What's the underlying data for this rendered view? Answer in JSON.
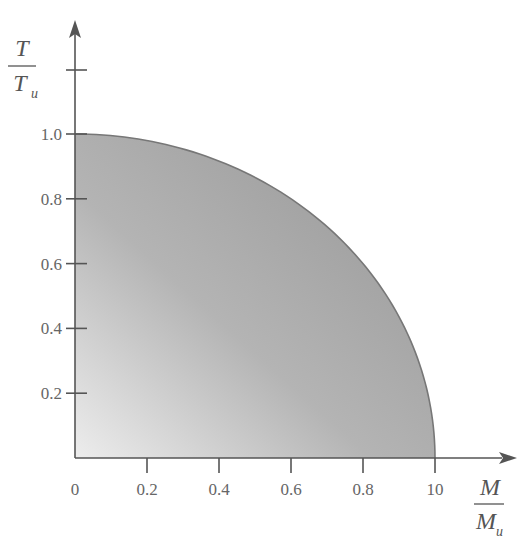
{
  "chart_data": {
    "type": "area",
    "title": "",
    "xlabel": "M / M_u",
    "ylabel": "T / T_u",
    "xlabel_parts": {
      "numerator": "M",
      "denominator": "M",
      "subscript": "u"
    },
    "ylabel_parts": {
      "numerator": "T",
      "denominator": "T",
      "subscript": "u"
    },
    "x_ticks": [
      "0",
      "0.2",
      "0.4",
      "0.6",
      "0.8",
      "10"
    ],
    "x_tick_values": [
      0,
      0.2,
      0.4,
      0.6,
      0.8,
      1.0
    ],
    "y_ticks": [
      "0.2",
      "0.4",
      "0.6",
      "0.8",
      "1.0"
    ],
    "y_tick_values": [
      0.2,
      0.4,
      0.6,
      0.8,
      1.0
    ],
    "y_extra_tick": 1.2,
    "xlim": [
      0,
      1.2
    ],
    "ylim": [
      0,
      1.3
    ],
    "grid": false,
    "legend": null,
    "series": [
      {
        "name": "Interaction envelope (M/Mu)^2 + (T/Tu)^2 = 1",
        "x": [
          0,
          0.2,
          0.4,
          0.6,
          0.8,
          0.9,
          1.0
        ],
        "y": [
          1.0,
          0.98,
          0.917,
          0.8,
          0.6,
          0.436,
          0.0
        ],
        "fill": "gradient gray"
      }
    ]
  },
  "colors": {
    "axis": "#555555",
    "curve": "#777777",
    "fill_light": "#ebebeb",
    "fill_dark": "#a4a4a4",
    "text": "#666666"
  }
}
